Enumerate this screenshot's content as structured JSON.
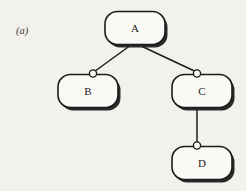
{
  "figure": {
    "panel_label": "(a)",
    "caption": "",
    "background_color": "#f3f1ec",
    "ink_color": "#1b1b1b",
    "node_fill_color": "#faf9f5",
    "shadow_color": "#2a2a2a"
  },
  "diagram": {
    "type": "tree",
    "nodes": [
      {
        "id": "A",
        "label": "A",
        "x": 135,
        "y": 28,
        "width": 60,
        "height": 33
      },
      {
        "id": "B",
        "label": "B",
        "x": 88,
        "y": 91,
        "width": 60,
        "height": 33
      },
      {
        "id": "C",
        "label": "C",
        "x": 202,
        "y": 91,
        "width": 60,
        "height": 33
      },
      {
        "id": "D",
        "label": "D",
        "x": 202,
        "y": 163,
        "width": 60,
        "height": 33
      }
    ],
    "edges": [
      {
        "from": "A",
        "to": "B",
        "connector": "circle"
      },
      {
        "from": "A",
        "to": "C",
        "connector": "circle"
      },
      {
        "from": "C",
        "to": "D",
        "connector": "circle"
      }
    ]
  }
}
